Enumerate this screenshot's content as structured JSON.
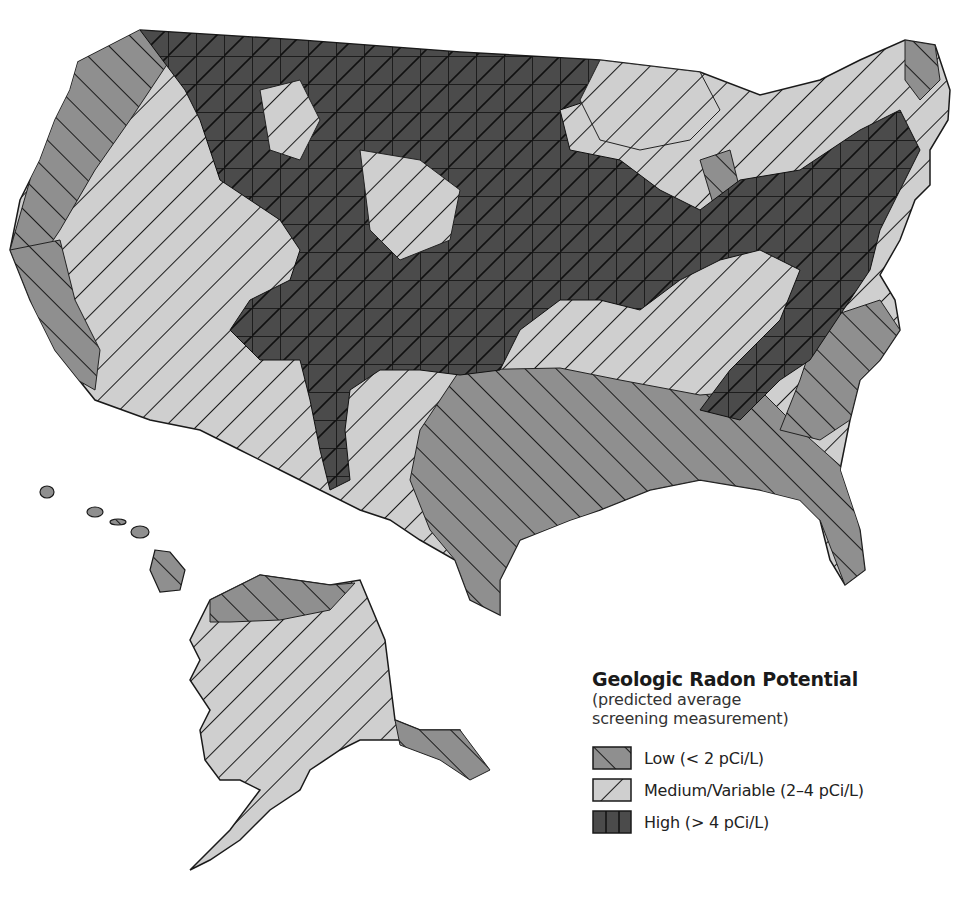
{
  "map": {
    "title": "Geologic Radon Potential",
    "subtitle_line1": "(predicted average",
    "subtitle_line2": "screening measurement)",
    "regions_shown": [
      "Contiguous United States",
      "Alaska",
      "Hawaii"
    ],
    "legend": {
      "items": [
        {
          "key": "low",
          "label": "Low (< 2 pCi/L)",
          "fill": "#8f8f8f",
          "hatch": "forward-diagonal"
        },
        {
          "key": "medium",
          "label": "Medium/Variable (2–4 pCi/L)",
          "fill": "#cfcfcf",
          "hatch": "back-diagonal"
        },
        {
          "key": "high",
          "label": "High (> 4 pCi/L)",
          "fill": "#4b4b4b",
          "hatch": "grid-with-diagonal"
        }
      ]
    },
    "colors": {
      "low": "#8f8f8f",
      "medium": "#cfcfcf",
      "high": "#4b4b4b",
      "line": "#1a1a1a",
      "background": "#ffffff"
    }
  }
}
